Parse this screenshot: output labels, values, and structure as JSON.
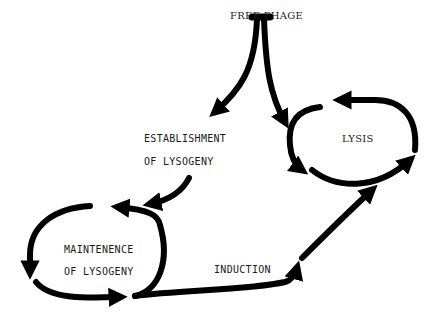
{
  "diagram": {
    "nodes": {
      "free_phage": "FREE PHAGE",
      "establishment_line1": "ESTABLISHMENT",
      "establishment_line2": "OF LYSOGENY",
      "lysis": "LYSIS",
      "maintenance_line1": "MAINTENENCE",
      "maintenance_line2": "OF LYSOGENY",
      "induction": "INDUCTION"
    },
    "edges": [
      {
        "from": "FREE PHAGE",
        "to": "ESTABLISHMENT OF LYSOGENY"
      },
      {
        "from": "FREE PHAGE",
        "to": "LYSIS"
      },
      {
        "from": "ESTABLISHMENT OF LYSOGENY",
        "to": "MAINTENENCE OF LYSOGENY"
      },
      {
        "from": "MAINTENENCE OF LYSOGENY",
        "to": "LYSIS",
        "label": "INDUCTION"
      }
    ],
    "colors": {
      "stroke": "#000000",
      "background": "#ffffff",
      "text": "#1a1a1a"
    }
  }
}
